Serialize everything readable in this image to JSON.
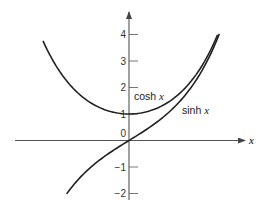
{
  "chart_data": {
    "type": "line",
    "title": "",
    "xlabel": "x",
    "ylabel": "",
    "xlim": [
      -2.7,
      2.7
    ],
    "ylim": [
      -2.2,
      4.8
    ],
    "grid": false,
    "legend": "inline labels",
    "y_ticks": [
      4,
      3,
      2,
      1,
      0,
      -1,
      -2
    ],
    "y_tick_labels": [
      "4",
      "3",
      "2",
      "1",
      "0",
      "−1",
      "−2"
    ],
    "series": [
      {
        "name": "cosh x",
        "label_main": "cosh",
        "label_var": "x",
        "x": [
          -2.0,
          -1.5,
          -1.0,
          -0.5,
          0.0,
          0.5,
          1.0,
          1.5,
          2.0,
          2.06
        ],
        "values": [
          3.76,
          2.35,
          1.54,
          1.13,
          1.0,
          1.13,
          1.54,
          2.35,
          3.76,
          3.99
        ],
        "x_range": [
          -2.0,
          2.06
        ]
      },
      {
        "name": "sinh x",
        "label_main": "sinh",
        "label_var": "x",
        "x": [
          -1.45,
          -1.0,
          -0.5,
          0.0,
          0.5,
          1.0,
          1.5,
          2.0,
          2.1
        ],
        "values": [
          -2.02,
          -1.18,
          -0.52,
          0.0,
          0.52,
          1.18,
          2.13,
          3.63,
          4.02
        ],
        "x_range": [
          -1.45,
          2.1
        ]
      }
    ]
  },
  "axes": {
    "x_axis_label": "x"
  }
}
